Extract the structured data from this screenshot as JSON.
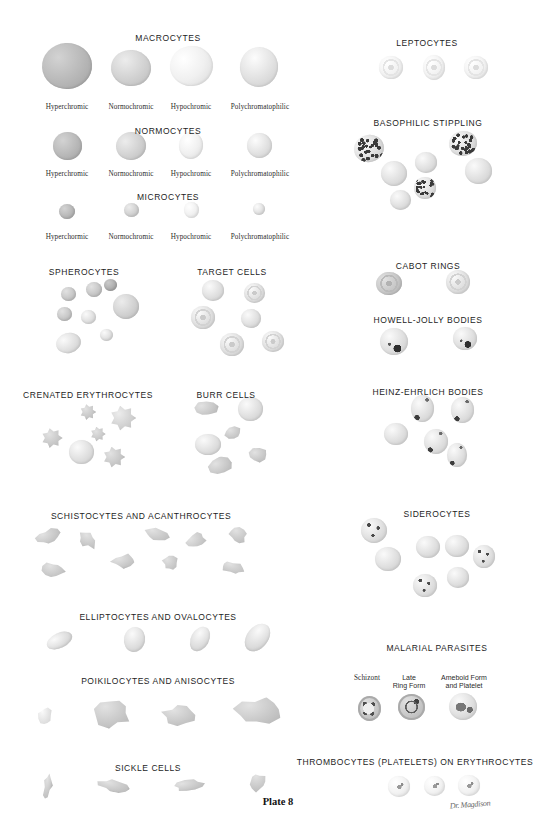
{
  "plate": {
    "number_label": "Plate 8",
    "signature": "Dr. Magdison",
    "background": "#ffffff",
    "ink": "#1d1d1d",
    "subject": "Erythrocyte morphology and red blood cell abnormalities"
  },
  "sections": [
    {
      "id": "macrocytes",
      "title": "MACROCYTES",
      "title_x": 168,
      "title_y": 33,
      "variants": [
        {
          "label": "Hyperchromic",
          "x": 67,
          "y": 103
        },
        {
          "label": "Normochromic",
          "x": 131,
          "y": 103
        },
        {
          "label": "Hypochromic",
          "x": 191,
          "y": 103
        },
        {
          "label": "Polychromatophilic",
          "x": 260,
          "y": 103
        }
      ],
      "cells": [
        {
          "cx": 67,
          "cy": 66,
          "w": 50,
          "h": 46,
          "tone": "hyper",
          "rot": -4
        },
        {
          "cx": 131,
          "cy": 68,
          "w": 40,
          "h": 36,
          "tone": "normo",
          "rot": 6
        },
        {
          "cx": 191,
          "cy": 66,
          "w": 43,
          "h": 40,
          "tone": "hypo",
          "rot": -8
        },
        {
          "cx": 259,
          "cy": 67,
          "w": 38,
          "h": 40,
          "tone": "poly",
          "rot": 12
        }
      ]
    },
    {
      "id": "normocytes",
      "title": "NORMOCYTES",
      "title_x": 168,
      "title_y": 126,
      "variants": [
        {
          "label": "Hyperchromic",
          "x": 67,
          "y": 170
        },
        {
          "label": "Normochromic",
          "x": 131,
          "y": 170
        },
        {
          "label": "Hypochromic",
          "x": 191,
          "y": 170
        },
        {
          "label": "Polychromatophilic",
          "x": 260,
          "y": 170
        }
      ],
      "cells": [
        {
          "cx": 67,
          "cy": 146,
          "w": 29,
          "h": 28,
          "tone": "hyper",
          "rot": 0
        },
        {
          "cx": 131,
          "cy": 146,
          "w": 30,
          "h": 28,
          "tone": "normo",
          "rot": -10
        },
        {
          "cx": 191,
          "cy": 145,
          "w": 24,
          "h": 27,
          "tone": "hypo",
          "rot": 4
        },
        {
          "cx": 259,
          "cy": 145,
          "w": 25,
          "h": 25,
          "tone": "poly",
          "rot": 0
        }
      ]
    },
    {
      "id": "microcytes",
      "title": "MICROCYTES",
      "title_x": 168,
      "title_y": 192,
      "variants": [
        {
          "label": "Hyperchormic",
          "x": 67,
          "y": 233
        },
        {
          "label": "Normochromic",
          "x": 131,
          "y": 233
        },
        {
          "label": "Hypochromic",
          "x": 191,
          "y": 233
        },
        {
          "label": "Polychromatophilic",
          "x": 260,
          "y": 233
        }
      ],
      "cells": [
        {
          "cx": 67,
          "cy": 211,
          "w": 16,
          "h": 15,
          "tone": "hyper",
          "rot": 0
        },
        {
          "cx": 131,
          "cy": 210,
          "w": 15,
          "h": 14,
          "tone": "normo",
          "rot": 0
        },
        {
          "cx": 191,
          "cy": 210,
          "w": 15,
          "h": 16,
          "tone": "hypo",
          "rot": 0
        },
        {
          "cx": 259,
          "cy": 209,
          "w": 12,
          "h": 12,
          "tone": "poly",
          "rot": 0
        }
      ]
    },
    {
      "id": "spherocytes",
      "title": "SPHEROCYTES",
      "title_x": 84,
      "title_y": 267,
      "variants": [],
      "cells": [
        {
          "cx": 68,
          "cy": 294,
          "w": 15,
          "h": 14,
          "tone": "mid",
          "rot": 0
        },
        {
          "cx": 94,
          "cy": 289,
          "w": 16,
          "h": 15,
          "tone": "mid",
          "rot": 0
        },
        {
          "cx": 110,
          "cy": 285,
          "w": 13,
          "h": 12,
          "tone": "dark",
          "rot": 0
        },
        {
          "cx": 126,
          "cy": 306,
          "w": 26,
          "h": 25,
          "tone": "normo",
          "rot": 0
        },
        {
          "cx": 64,
          "cy": 314,
          "w": 15,
          "h": 14,
          "tone": "mid",
          "rot": 0
        },
        {
          "cx": 88,
          "cy": 317,
          "w": 15,
          "h": 14,
          "tone": "light",
          "rot": 0
        },
        {
          "cx": 106,
          "cy": 335,
          "w": 13,
          "h": 12,
          "tone": "light",
          "rot": 0
        },
        {
          "cx": 68,
          "cy": 343,
          "w": 25,
          "h": 20,
          "tone": "light",
          "rot": -15
        }
      ]
    },
    {
      "id": "target-cells",
      "title": "TARGET CELLS",
      "title_x": 232,
      "title_y": 267,
      "variants": [],
      "cells": [
        {
          "cx": 213,
          "cy": 290,
          "w": 22,
          "h": 21,
          "tone": "light",
          "rot": 0,
          "target": false
        },
        {
          "cx": 254,
          "cy": 293,
          "w": 21,
          "h": 20,
          "tone": "light",
          "rot": 0,
          "target": true
        },
        {
          "cx": 203,
          "cy": 317,
          "w": 24,
          "h": 23,
          "tone": "light",
          "rot": 0,
          "target": true
        },
        {
          "cx": 251,
          "cy": 318,
          "w": 20,
          "h": 19,
          "tone": "light",
          "rot": 0,
          "target": false
        },
        {
          "cx": 232,
          "cy": 344,
          "w": 24,
          "h": 23,
          "tone": "light",
          "rot": 0,
          "target": true
        },
        {
          "cx": 273,
          "cy": 341,
          "w": 22,
          "h": 21,
          "tone": "light",
          "rot": 0,
          "target": true
        }
      ]
    },
    {
      "id": "crenated-erythrocytes",
      "title": "CRENATED ERYTHROCYTES",
      "title_x": 88,
      "title_y": 390,
      "variants": [],
      "cells": [
        {
          "cx": 88,
          "cy": 412,
          "w": 16,
          "h": 16,
          "tone": "mid",
          "rot": 0,
          "spiky": true
        },
        {
          "cx": 123,
          "cy": 418,
          "w": 26,
          "h": 25,
          "tone": "normo",
          "rot": 0,
          "spiky": true
        },
        {
          "cx": 98,
          "cy": 434,
          "w": 15,
          "h": 15,
          "tone": "mid",
          "rot": 0,
          "spiky": true
        },
        {
          "cx": 52,
          "cy": 438,
          "w": 21,
          "h": 20,
          "tone": "mid",
          "rot": 0,
          "spiky": true
        },
        {
          "cx": 81,
          "cy": 452,
          "w": 25,
          "h": 24,
          "tone": "light",
          "rot": 0,
          "spiky": false
        },
        {
          "cx": 114,
          "cy": 457,
          "w": 22,
          "h": 21,
          "tone": "mid",
          "rot": 0,
          "spiky": true
        }
      ]
    },
    {
      "id": "burr-cells",
      "title": "BURR CELLS",
      "title_x": 226,
      "title_y": 390,
      "variants": [],
      "cells": [
        {
          "cx": 206,
          "cy": 408,
          "w": 26,
          "h": 17,
          "tone": "mid",
          "rot": -10,
          "irregular": true
        },
        {
          "cx": 250,
          "cy": 409,
          "w": 25,
          "h": 24,
          "tone": "light",
          "rot": 0,
          "irregular": false
        },
        {
          "cx": 233,
          "cy": 433,
          "w": 18,
          "h": 14,
          "tone": "mid",
          "rot": 0,
          "irregular": true
        },
        {
          "cx": 208,
          "cy": 444,
          "w": 26,
          "h": 21,
          "tone": "light",
          "rot": 0,
          "irregular": false
        },
        {
          "cx": 258,
          "cy": 455,
          "w": 20,
          "h": 15,
          "tone": "mid",
          "rot": 0,
          "irregular": true
        },
        {
          "cx": 220,
          "cy": 466,
          "w": 25,
          "h": 18,
          "tone": "mid",
          "rot": -18,
          "irregular": true
        }
      ]
    },
    {
      "id": "schistocytes-acanthrocytes",
      "title": "SCHISTOCYTES AND ACANTHROCYTES",
      "title_x": 141,
      "title_y": 511,
      "variants": [],
      "cells": [
        {
          "cx": 48,
          "cy": 536,
          "w": 28,
          "h": 17,
          "tone": "mid",
          "rot": -18
        },
        {
          "cx": 88,
          "cy": 540,
          "w": 24,
          "h": 18,
          "tone": "mid",
          "rot": 30
        },
        {
          "cx": 53,
          "cy": 570,
          "w": 25,
          "h": 18,
          "tone": "mid",
          "rot": 8
        },
        {
          "cx": 124,
          "cy": 561,
          "w": 30,
          "h": 16,
          "tone": "mid",
          "rot": -12
        },
        {
          "cx": 156,
          "cy": 534,
          "w": 30,
          "h": 17,
          "tone": "mid",
          "rot": 12
        },
        {
          "cx": 170,
          "cy": 563,
          "w": 18,
          "h": 18,
          "tone": "mid",
          "rot": 0
        },
        {
          "cx": 196,
          "cy": 540,
          "w": 26,
          "h": 19,
          "tone": "mid",
          "rot": -25
        },
        {
          "cx": 238,
          "cy": 535,
          "w": 22,
          "h": 18,
          "tone": "mid",
          "rot": 20
        },
        {
          "cx": 233,
          "cy": 568,
          "w": 28,
          "h": 14,
          "tone": "mid",
          "rot": 18
        }
      ]
    },
    {
      "id": "elliptocytes-ovalocytes",
      "title": "ELLIPTOCYTES AND OVALOCYTES",
      "title_x": 158,
      "title_y": 612,
      "variants": [],
      "cells": [
        {
          "cx": 59,
          "cy": 640,
          "w": 27,
          "h": 15,
          "tone": "light",
          "rot": -25
        },
        {
          "cx": 134,
          "cy": 639,
          "w": 21,
          "h": 25,
          "tone": "light",
          "rot": 12
        },
        {
          "cx": 200,
          "cy": 639,
          "w": 18,
          "h": 26,
          "tone": "light",
          "rot": 28
        },
        {
          "cx": 257,
          "cy": 637,
          "w": 21,
          "h": 31,
          "tone": "light",
          "rot": 38
        }
      ]
    },
    {
      "id": "poikilocytes-anisocytes",
      "title": "POIKILOCYTES AND ANISOCYTES",
      "title_x": 158,
      "title_y": 676,
      "variants": [],
      "cells": [
        {
          "cx": 45,
          "cy": 716,
          "w": 16,
          "h": 22,
          "tone": "light",
          "rot": 0
        },
        {
          "cx": 112,
          "cy": 713,
          "w": 42,
          "h": 32,
          "tone": "mid",
          "rot": 0
        },
        {
          "cx": 180,
          "cy": 715,
          "w": 40,
          "h": 24,
          "tone": "mid",
          "rot": 0
        },
        {
          "cx": 258,
          "cy": 711,
          "w": 52,
          "h": 32,
          "tone": "mid",
          "rot": -5
        }
      ]
    },
    {
      "id": "sickle-cells",
      "title": "SICKLE CELLS",
      "title_x": 148,
      "title_y": 763,
      "variants": [],
      "cells": [
        {
          "cx": 48,
          "cy": 785,
          "w": 10,
          "h": 30,
          "tone": "mid",
          "rot": 10
        },
        {
          "cx": 113,
          "cy": 786,
          "w": 34,
          "h": 14,
          "tone": "mid",
          "rot": 10
        },
        {
          "cx": 188,
          "cy": 785,
          "w": 36,
          "h": 13,
          "tone": "mid",
          "rot": -8
        },
        {
          "cx": 257,
          "cy": 782,
          "w": 22,
          "h": 22,
          "tone": "mid",
          "rot": 30
        }
      ]
    },
    {
      "id": "leptocytes",
      "title": "LEPTOCYTES",
      "title_x": 427,
      "title_y": 38,
      "variants": [],
      "cells": [
        {
          "cx": 391,
          "cy": 67,
          "w": 24,
          "h": 23,
          "tone": "pale",
          "rot": 0,
          "target": true
        },
        {
          "cx": 434,
          "cy": 67,
          "w": 22,
          "h": 25,
          "tone": "pale",
          "rot": 0,
          "target": true
        },
        {
          "cx": 476,
          "cy": 67,
          "w": 24,
          "h": 23,
          "tone": "pale",
          "rot": 0,
          "target": true
        }
      ]
    },
    {
      "id": "basophilic-stippling",
      "title": "BASOPHILIC STIPPLING",
      "title_x": 428,
      "title_y": 118,
      "variants": [],
      "cells": [
        {
          "cx": 369,
          "cy": 148,
          "w": 30,
          "h": 27,
          "tone": "light",
          "rot": -15,
          "stippled": true
        },
        {
          "cx": 394,
          "cy": 173,
          "w": 26,
          "h": 25,
          "tone": "light",
          "rot": 0,
          "stippled": false
        },
        {
          "cx": 426,
          "cy": 162,
          "w": 22,
          "h": 21,
          "tone": "light",
          "rot": 0,
          "stippled": false
        },
        {
          "cx": 425,
          "cy": 188,
          "w": 22,
          "h": 22,
          "tone": "light",
          "rot": 0,
          "stippled": true
        },
        {
          "cx": 400,
          "cy": 200,
          "w": 21,
          "h": 20,
          "tone": "light",
          "rot": 0,
          "stippled": false
        },
        {
          "cx": 463,
          "cy": 143,
          "w": 28,
          "h": 25,
          "tone": "light",
          "rot": -10,
          "stippled": true
        },
        {
          "cx": 478,
          "cy": 171,
          "w": 27,
          "h": 26,
          "tone": "light",
          "rot": 0,
          "stippled": false
        }
      ]
    },
    {
      "id": "cabot-rings",
      "title": "CABOT RINGS",
      "title_x": 428,
      "title_y": 261,
      "variants": [],
      "cells": [
        {
          "cx": 389,
          "cy": 283,
          "w": 26,
          "h": 23,
          "tone": "mid",
          "rot": -8,
          "ring": true
        },
        {
          "cx": 458,
          "cy": 282,
          "w": 24,
          "h": 24,
          "tone": "light",
          "rot": 0,
          "ring": true
        }
      ]
    },
    {
      "id": "howell-jolly-bodies",
      "title": "HOWELL-JOLLY BODIES",
      "title_x": 428,
      "title_y": 315,
      "variants": [],
      "cells": [
        {
          "cx": 394,
          "cy": 341,
          "w": 28,
          "h": 27,
          "tone": "light",
          "rot": 0,
          "hj": true
        },
        {
          "cx": 465,
          "cy": 338,
          "w": 24,
          "h": 23,
          "tone": "light",
          "rot": 0,
          "hj": true
        }
      ]
    },
    {
      "id": "heinz-ehrlich-bodies",
      "title": "HEINZ-EHRLICH BODIES",
      "title_x": 428,
      "title_y": 387,
      "variants": [],
      "cells": [
        {
          "cx": 422,
          "cy": 408,
          "w": 23,
          "h": 27,
          "tone": "light",
          "rot": 0,
          "heinz": true
        },
        {
          "cx": 462,
          "cy": 410,
          "w": 23,
          "h": 26,
          "tone": "light",
          "rot": 0,
          "heinz": true
        },
        {
          "cx": 396,
          "cy": 434,
          "w": 24,
          "h": 22,
          "tone": "light",
          "rot": 0,
          "heinz": false
        },
        {
          "cx": 436,
          "cy": 441,
          "w": 24,
          "h": 25,
          "tone": "light",
          "rot": 0,
          "heinz": true
        },
        {
          "cx": 457,
          "cy": 455,
          "w": 20,
          "h": 24,
          "tone": "light",
          "rot": 0,
          "heinz": true
        }
      ]
    },
    {
      "id": "siderocytes",
      "title": "SIDEROCYTES",
      "title_x": 437,
      "title_y": 509,
      "variants": [],
      "cells": [
        {
          "cx": 374,
          "cy": 530,
          "w": 26,
          "h": 25,
          "tone": "light",
          "rot": 0,
          "siderotic": true
        },
        {
          "cx": 388,
          "cy": 559,
          "w": 26,
          "h": 24,
          "tone": "light",
          "rot": 0,
          "siderotic": false
        },
        {
          "cx": 428,
          "cy": 547,
          "w": 24,
          "h": 22,
          "tone": "light",
          "rot": 0,
          "siderotic": false
        },
        {
          "cx": 457,
          "cy": 546,
          "w": 24,
          "h": 22,
          "tone": "light",
          "rot": 0,
          "siderotic": false
        },
        {
          "cx": 484,
          "cy": 556,
          "w": 22,
          "h": 23,
          "tone": "light",
          "rot": 0,
          "siderotic": true
        },
        {
          "cx": 425,
          "cy": 585,
          "w": 24,
          "h": 23,
          "tone": "light",
          "rot": 0,
          "siderotic": true
        },
        {
          "cx": 458,
          "cy": 577,
          "w": 22,
          "h": 21,
          "tone": "light",
          "rot": 0,
          "siderotic": false
        }
      ]
    },
    {
      "id": "malarial-parasites",
      "title": "MALARIAL PARASITES",
      "title_x": 437,
      "title_y": 643,
      "variants": [
        {
          "label": "Schizont",
          "x": 367,
          "y": 674
        },
        {
          "label": "Late\nRing Form",
          "x": 409,
          "y": 674
        },
        {
          "label": "Ameboid Form\nand Platelet",
          "x": 464,
          "y": 674
        }
      ],
      "cells": [
        {
          "cx": 369,
          "cy": 708,
          "w": 23,
          "h": 25,
          "tone": "mid",
          "rot": 0,
          "parasite": "schizont"
        },
        {
          "cx": 411,
          "cy": 707,
          "w": 27,
          "h": 26,
          "tone": "mid",
          "rot": 0,
          "parasite": "ring"
        },
        {
          "cx": 463,
          "cy": 706,
          "w": 28,
          "h": 27,
          "tone": "light",
          "rot": 0,
          "parasite": "ameboid"
        }
      ]
    },
    {
      "id": "thrombocytes-on-erythrocytes",
      "title": "THROMBOCYTES (PLATELETS) ON ERYTHROCYTES",
      "title_x": 415,
      "title_y": 757,
      "variants": [],
      "cells": [
        {
          "cx": 399,
          "cy": 786,
          "w": 22,
          "h": 21,
          "tone": "pale",
          "rot": 0,
          "platelet": true
        },
        {
          "cx": 434,
          "cy": 786,
          "w": 21,
          "h": 20,
          "tone": "pale",
          "rot": 0,
          "platelet": true
        },
        {
          "cx": 469,
          "cy": 785,
          "w": 22,
          "h": 21,
          "tone": "pale",
          "rot": 0,
          "platelet": true
        }
      ]
    }
  ],
  "tones": {
    "hyper": "#b9b9b9",
    "normo": "#d2d2d2",
    "hypo": "#f0f0f0",
    "poly": "#e2e2e2",
    "dark": "#b0b0b0",
    "mid": "#c8c8c8",
    "light": "#e0e0e0",
    "pale": "#f2f2f2"
  },
  "plate_footer": {
    "x": 278,
    "y": 802,
    "signature_x": 470,
    "signature_y": 806
  }
}
